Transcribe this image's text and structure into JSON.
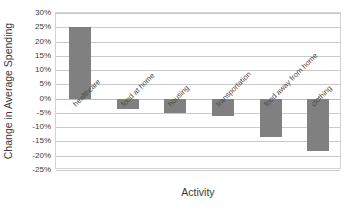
{
  "chart_data": {
    "type": "bar",
    "title": "",
    "xlabel": "Activity",
    "ylabel": "Change in Average Spending",
    "categories": [
      "healthcare",
      "food at home",
      "housing",
      "transportation",
      "food away from home",
      "clothing"
    ],
    "values": [
      25,
      -3.5,
      -5,
      -6,
      -13.5,
      -18.5
    ],
    "ylim": [
      -25,
      30
    ],
    "ytick_labels": [
      "30%",
      "25%",
      "20%",
      "15%",
      "10%",
      "5%",
      "0%",
      "-5%",
      "-10%",
      "-15%",
      "-20%",
      "-25%"
    ],
    "ytick_values": [
      30,
      25,
      20,
      15,
      10,
      5,
      0,
      -5,
      -10,
      -15,
      -20,
      -25
    ],
    "grid": true,
    "legend": false,
    "bar_color": "#808080",
    "gridline_color": "#c9c9c9",
    "plot_border_color": "#d3d3d3"
  }
}
